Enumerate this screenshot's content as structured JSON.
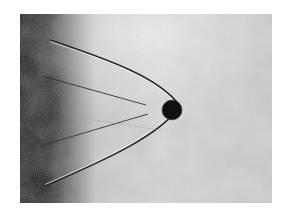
{
  "image": {
    "subject": "shadowgraph of sphere with bow shock wave",
    "description": "Black sphere moving to the right, parabolic bow shock trailing to the left, dark gradient at left edge, grainy grey background",
    "colors": {
      "background": "#ffffff",
      "frame_light": "#e6e6e6",
      "frame_grey": "#c8c8c8",
      "dark_edge": "#1a1a1a",
      "sphere": "#111111",
      "shock_line": "#2a2a2a"
    },
    "frame": {
      "x": 20,
      "y": 14,
      "width": 252,
      "height": 189
    },
    "sphere": {
      "cx": 172,
      "cy": 110,
      "r": 10
    }
  }
}
